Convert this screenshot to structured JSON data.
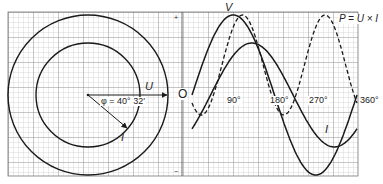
{
  "labels": {
    "voltage_phasor": "U",
    "current_phasor": "I",
    "phase_angle": "φ = 40° 32′",
    "origin": "O",
    "voltage_wave": "V",
    "current_wave": "I",
    "power_wave": "P = U × I",
    "axis_plus": "+",
    "axis_minus": "−",
    "deg_90": "90°",
    "deg_180": "180°",
    "deg_270": "270°",
    "deg_360": "360°"
  },
  "colors": {
    "grid_minor": "#b8b8b8",
    "grid_major": "#8a8a8a",
    "curve": "#1a1a1a",
    "background": "#ffffff"
  },
  "phasor": {
    "center": [
      88,
      95
    ],
    "outer_radius": 80,
    "inner_radius": 52,
    "phase_angle_deg": 40.53
  },
  "waveform": {
    "x0_px": 192,
    "x360_px": 357,
    "baseline_px": 95,
    "voltage_amplitude_px": 80,
    "current_amplitude_px": 52,
    "current_lag_deg": 40.53,
    "power_dashed": true
  }
}
